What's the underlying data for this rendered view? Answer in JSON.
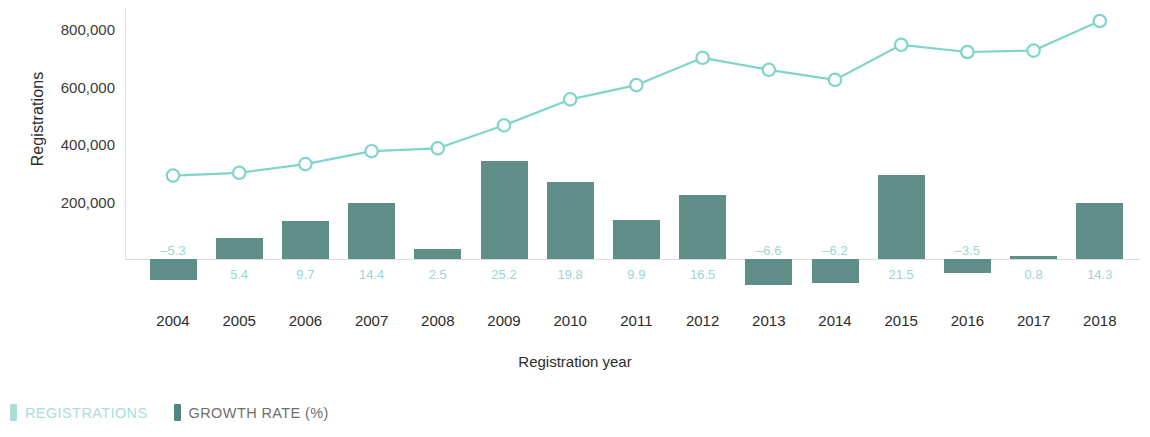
{
  "chart_data": {
    "type": "bar",
    "title": "",
    "xlabel": "Registration year",
    "ylabel": "Registrations",
    "categories": [
      "2004",
      "2005",
      "2006",
      "2007",
      "2008",
      "2009",
      "2010",
      "2011",
      "2012",
      "2013",
      "2014",
      "2015",
      "2016",
      "2017",
      "2018"
    ],
    "y_ticks": [
      "200,000",
      "400,000",
      "600,000",
      "800,000"
    ],
    "ylim": [
      0,
      900000
    ],
    "grid": false,
    "legend_position": "bottom-left",
    "series": [
      {
        "name": "REGISTRATIONS",
        "type": "line",
        "color": "#7fd4cc",
        "axis": "left",
        "values": [
          290000,
          300000,
          330000,
          375000,
          385000,
          465000,
          555000,
          605000,
          700000,
          658000,
          623000,
          745000,
          720000,
          725000,
          828000
        ]
      },
      {
        "name": "GROWTH RATE (%)",
        "type": "bar",
        "color": "#52857f",
        "axis": "right",
        "values": [
          -5.3,
          5.4,
          9.7,
          14.4,
          2.5,
          25.2,
          19.8,
          9.9,
          16.5,
          -6.6,
          -6.2,
          21.5,
          -3.5,
          0.8,
          14.3
        ],
        "labels": [
          "–5.3",
          "5.4",
          "9.7",
          "14.4",
          "2.5",
          "25.2",
          "19.8",
          "9.9",
          "16.5",
          "–6.6",
          "–6.2",
          "21.5",
          "–3.5",
          "0.8",
          "14.3"
        ]
      }
    ]
  },
  "axes": {
    "y_title": "Registrations",
    "x_title": "Registration year"
  },
  "legend": {
    "items": [
      {
        "label": "REGISTRATIONS",
        "color": "#a8ded8"
      },
      {
        "label": "GROWTH RATE (%)",
        "color": "#52857f"
      }
    ]
  },
  "colors": {
    "line": "#7fd4cc",
    "bar": "#52857f",
    "bar_label": "#9bd6d0",
    "axis": "#e2e2e2",
    "text": "#2b2b2b"
  }
}
